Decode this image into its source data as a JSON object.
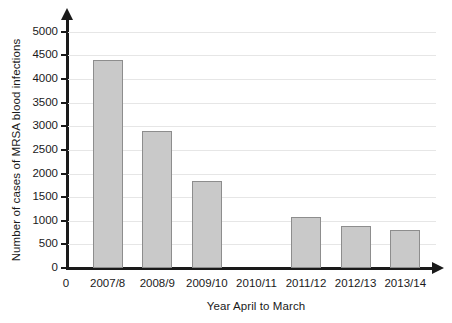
{
  "chart_data": {
    "type": "bar",
    "title": "",
    "xlabel": "Year April to March",
    "ylabel": "Number of cases of MRSA blood infections",
    "categories": [
      "2007/8",
      "2008/9",
      "2009/10",
      "2010/11",
      "2011/12",
      "2012/13",
      "2013/14"
    ],
    "values": [
      4400,
      2900,
      1850,
      0,
      1075,
      900,
      800
    ],
    "ylim": [
      0,
      5250
    ],
    "ytick_values": [
      0,
      500,
      1000,
      1500,
      2000,
      2500,
      3000,
      3500,
      4000,
      4500,
      5000
    ],
    "ytick_labels": [
      "0",
      "500",
      "1000",
      "1500",
      "2000",
      "2500",
      "3000",
      "3500",
      "4000",
      "4500",
      "5000"
    ],
    "origin_label": "0",
    "grid": true,
    "grid_axis": "y",
    "legend": false,
    "legend_position": "none",
    "bar_fill_color": "#c9c9c9",
    "bar_border_color": "#8d8d8d",
    "axis_color": "#1a1a1a",
    "gridline_color": "#e6e6e6",
    "background_color": "#ffffff"
  }
}
